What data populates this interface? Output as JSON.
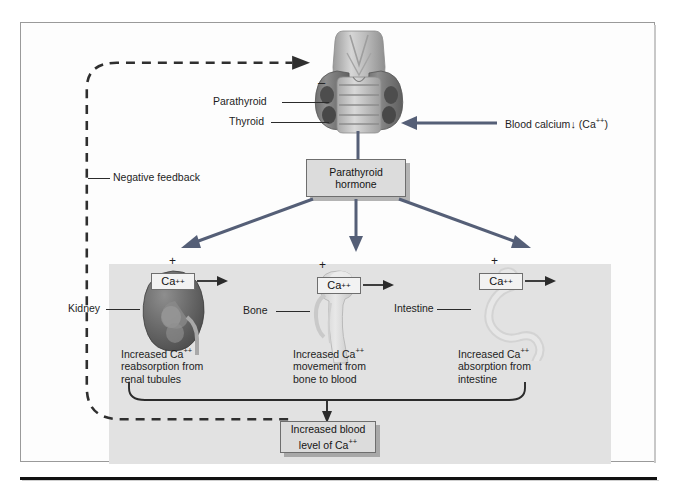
{
  "figure": {
    "frame_color": "#9a9a9a",
    "band_color": "#e2e2e2",
    "arrow_color": "#555f77",
    "box_fill": "#dcdcdc"
  },
  "stimulus": {
    "label": "Blood calcium",
    "arrow_glyph": "↓",
    "ion": "(Ca++)",
    "ion_base": "(Ca",
    "ion_sup": "++",
    "ion_tail": ")"
  },
  "gland": {
    "parathyroid_label": "Parathyroid",
    "thyroid_label": "Thyroid",
    "minus_sign": "–"
  },
  "hormone": {
    "line1": "Parathyroid",
    "line2": "hormone"
  },
  "feedback": {
    "label": "Negative feedback",
    "style": "dashed"
  },
  "targets": [
    {
      "name": "kidney",
      "organ_label": "Kidney",
      "plus": "+",
      "ca_base": "Ca",
      "ca_sup": "++",
      "effect_line1": "Increased Ca++",
      "effect_l1_base": "Increased Ca",
      "effect_l1_sup": "++",
      "effect_line2": "reabsorption from",
      "effect_line3": "renal tubules"
    },
    {
      "name": "bone",
      "organ_label": "Bone",
      "plus": "+",
      "ca_base": "Ca",
      "ca_sup": "++",
      "effect_line1": "Increased Ca++",
      "effect_l1_base": "Increased Ca",
      "effect_l1_sup": "++",
      "effect_line2": "movement from",
      "effect_line3": "bone to blood"
    },
    {
      "name": "intestine",
      "organ_label": "Intestine",
      "plus": "+",
      "ca_base": "Ca",
      "ca_sup": "++",
      "effect_line1": "Increased Ca++",
      "effect_l1_base": "Increased Ca",
      "effect_l1_sup": "++",
      "effect_line2": "absorption from",
      "effect_line3": "intestine"
    }
  ],
  "outcome": {
    "line1": "Increased blood",
    "line2_base": "level of Ca",
    "line2_sup": "++"
  }
}
